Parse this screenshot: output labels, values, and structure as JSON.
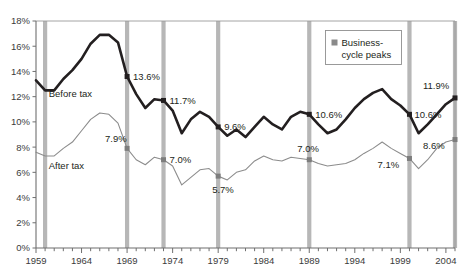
{
  "chart_data": {
    "type": "line",
    "title": "",
    "xlabel": "",
    "ylabel": "",
    "xlim": [
      1959,
      2005
    ],
    "ylim": [
      0,
      18
    ],
    "ytick_labels": [
      "0%",
      "2%",
      "4%",
      "6%",
      "8%",
      "10%",
      "12%",
      "14%",
      "16%",
      "18%"
    ],
    "ytick_values": [
      0,
      2,
      4,
      6,
      8,
      10,
      12,
      14,
      16,
      18
    ],
    "xtick_labels": [
      "1959",
      "1964",
      "1969",
      "1974",
      "1979",
      "1984",
      "1989",
      "1994",
      "1999",
      "2004"
    ],
    "xtick_values": [
      1959,
      1964,
      1969,
      1974,
      1979,
      1984,
      1989,
      1994,
      1999,
      2004
    ],
    "minor_xticks_every": 1,
    "grid": false,
    "legend_position": "top-right",
    "legend": [
      {
        "name": "Business-cycle peaks",
        "color": "#8a8a8a",
        "marker": "square"
      }
    ],
    "series": [
      {
        "name": "Before tax",
        "color": "#231f20",
        "width": 2.6,
        "label_text": "Before tax",
        "x": [
          1959,
          1960,
          1961,
          1962,
          1963,
          1964,
          1965,
          1966,
          1967,
          1968,
          1969,
          1970,
          1971,
          1972,
          1973,
          1974,
          1975,
          1976,
          1977,
          1978,
          1979,
          1980,
          1981,
          1982,
          1983,
          1984,
          1985,
          1986,
          1987,
          1988,
          1989,
          1990,
          1991,
          1992,
          1993,
          1994,
          1995,
          1996,
          1997,
          1998,
          1999,
          2000,
          2001,
          2002,
          2003,
          2004,
          2005
        ],
        "y": [
          13.3,
          12.5,
          12.5,
          13.4,
          14.1,
          15.0,
          16.2,
          16.9,
          16.9,
          16.3,
          13.6,
          12.2,
          11.1,
          11.8,
          11.7,
          10.9,
          9.1,
          10.2,
          10.8,
          10.4,
          9.6,
          8.9,
          9.4,
          8.8,
          9.6,
          10.4,
          9.8,
          9.4,
          10.4,
          10.8,
          10.6,
          9.8,
          9.1,
          9.4,
          10.2,
          11.1,
          11.8,
          12.3,
          12.6,
          11.8,
          11.3,
          10.6,
          9.1,
          9.8,
          10.6,
          11.4,
          11.9
        ]
      },
      {
        "name": "After tax",
        "color": "#8c8c8c",
        "width": 1.1,
        "label_text": "After tax",
        "x": [
          1959,
          1960,
          1961,
          1962,
          1963,
          1964,
          1965,
          1966,
          1967,
          1968,
          1969,
          1970,
          1971,
          1972,
          1973,
          1974,
          1975,
          1976,
          1977,
          1978,
          1979,
          1980,
          1981,
          1982,
          1983,
          1984,
          1985,
          1986,
          1987,
          1988,
          1989,
          1990,
          1991,
          1992,
          1993,
          1994,
          1995,
          1996,
          1997,
          1998,
          1999,
          2000,
          2001,
          2002,
          2003,
          2004,
          2005
        ],
        "y": [
          7.6,
          7.3,
          7.3,
          7.9,
          8.4,
          9.3,
          10.2,
          10.7,
          10.6,
          9.9,
          7.9,
          7.0,
          6.6,
          7.2,
          7.0,
          6.5,
          5.0,
          5.6,
          6.2,
          6.3,
          5.7,
          5.4,
          6.0,
          6.2,
          6.9,
          7.3,
          7.0,
          6.9,
          7.2,
          7.1,
          7.0,
          6.7,
          6.5,
          6.6,
          6.7,
          7.0,
          7.5,
          7.9,
          8.4,
          7.9,
          7.5,
          7.1,
          6.3,
          7.0,
          7.9,
          8.4,
          8.6
        ]
      }
    ],
    "business_cycle_peaks": [
      {
        "year": 1960
      },
      {
        "year": 1969
      },
      {
        "year": 1973
      },
      {
        "year": 1979
      },
      {
        "year": 1989
      },
      {
        "year": 2000
      },
      {
        "year": 2005
      }
    ],
    "annotations": [
      {
        "year": 1969,
        "series": "Before tax",
        "value": 13.6,
        "text": "13.6%",
        "marker": true,
        "dx": 6,
        "dy": 3.5
      },
      {
        "year": 1973,
        "series": "Before tax",
        "value": 11.7,
        "text": "11.7%",
        "marker": true,
        "dx": 6,
        "dy": 3.5
      },
      {
        "year": 1979,
        "series": "Before tax",
        "value": 9.6,
        "text": "9.6%",
        "marker": true,
        "dx": 6,
        "dy": 3.5
      },
      {
        "year": 1989,
        "series": "Before tax",
        "value": 10.6,
        "text": "10.6%",
        "marker": true,
        "dx": 6,
        "dy": 3.5
      },
      {
        "year": 2000,
        "series": "Before tax",
        "value": 10.6,
        "text": "10.6%",
        "marker": true,
        "dx": 5,
        "dy": 3.5
      },
      {
        "year": 2005,
        "series": "Before tax",
        "value": 11.9,
        "text": "11.9%",
        "marker": true,
        "dx": -32,
        "dy": -9
      },
      {
        "year": 1969,
        "series": "After tax",
        "value": 7.9,
        "text": "7.9%",
        "marker": true,
        "dx": -22,
        "dy": -6
      },
      {
        "year": 1973,
        "series": "After tax",
        "value": 7.0,
        "text": "7.0%",
        "marker": true,
        "dx": 6,
        "dy": 3.5
      },
      {
        "year": 1979,
        "series": "After tax",
        "value": 5.7,
        "text": "5.7%",
        "marker": true,
        "dx": -6,
        "dy": 17
      },
      {
        "year": 1989,
        "series": "After tax",
        "value": 7.0,
        "text": "7.0%",
        "marker": true,
        "dx": -12,
        "dy": -8
      },
      {
        "year": 2000,
        "series": "After tax",
        "value": 7.1,
        "text": "7.1%",
        "marker": true,
        "dx": -32,
        "dy": 10
      },
      {
        "year": 2005,
        "series": "After tax",
        "value": 8.6,
        "text": "8.6%",
        "marker": true,
        "dx": -32,
        "dy": 9
      }
    ],
    "series_inline_labels": [
      {
        "text": "Before tax",
        "x": 1960.4,
        "y": 12.0
      },
      {
        "text": "After tax",
        "x": 1960.4,
        "y": 6.3
      }
    ]
  },
  "legend_box": {
    "marker_color": "#8a8a8a",
    "line1": "Business-",
    "line2": "cycle peaks"
  },
  "colors": {
    "before_tax": "#231f20",
    "after_tax": "#8c8c8c",
    "peak_band": "#b7b7b7",
    "axis": "#6f6f6f",
    "plot_border": "#9a9a9a",
    "background": "#ffffff"
  }
}
